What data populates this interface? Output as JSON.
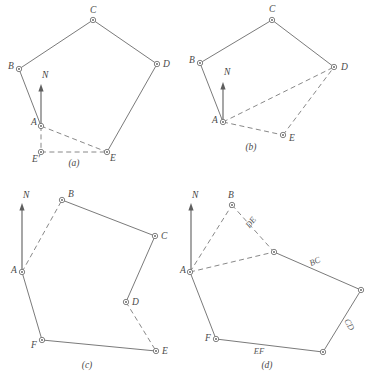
{
  "figure": {
    "panels": [
      {
        "id": "a",
        "caption": "(a)",
        "caption_pos": [
          74,
          166
        ],
        "north_label": "N",
        "north_label_pos": [
          42,
          78
        ],
        "north_arrow": {
          "x": 41,
          "y_tail": 128,
          "y_head": 84
        },
        "stations": [
          {
            "name": "A",
            "x": 41,
            "y": 126,
            "label": "A",
            "lx": 31,
            "ly": 125
          },
          {
            "name": "B",
            "x": 19,
            "y": 69,
            "label": "B",
            "lx": 8,
            "ly": 69
          },
          {
            "name": "C",
            "x": 93,
            "y": 20,
            "label": "C",
            "lx": 90,
            "ly": 13
          },
          {
            "name": "D",
            "x": 157,
            "y": 64,
            "label": "D",
            "lx": 163,
            "ly": 67
          },
          {
            "name": "E",
            "x": 107,
            "y": 152,
            "label": "E",
            "lx": 110,
            "ly": 161
          },
          {
            "name": "Ep",
            "x": 41,
            "y": 152,
            "label": "E'",
            "lx": 32,
            "ly": 162
          }
        ],
        "solid_edges": [
          [
            "A",
            "B"
          ],
          [
            "B",
            "C"
          ],
          [
            "C",
            "D"
          ],
          [
            "D",
            "E"
          ]
        ],
        "dashed_edges": [
          [
            "A",
            "E"
          ],
          [
            "A",
            "Ep"
          ],
          [
            "Ep",
            "E"
          ]
        ],
        "side_labels": []
      },
      {
        "id": "b",
        "caption": "(b)",
        "caption_pos": [
          251,
          150
        ],
        "north_label": "N",
        "north_label_pos": [
          224,
          75
        ],
        "north_arrow": {
          "x": 223,
          "y_tail": 124,
          "y_head": 82
        },
        "stations": [
          {
            "name": "A",
            "x": 223,
            "y": 122,
            "label": "A",
            "lx": 212,
            "ly": 123
          },
          {
            "name": "B",
            "x": 200,
            "y": 63,
            "label": "B",
            "lx": 189,
            "ly": 63
          },
          {
            "name": "C",
            "x": 272,
            "y": 20,
            "label": "C",
            "lx": 269,
            "ly": 12
          },
          {
            "name": "D",
            "x": 334,
            "y": 67,
            "label": "D",
            "lx": 341,
            "ly": 70
          },
          {
            "name": "E",
            "x": 283,
            "y": 135,
            "label": "E",
            "lx": 289,
            "ly": 141
          }
        ],
        "solid_edges": [
          [
            "A",
            "B"
          ],
          [
            "B",
            "C"
          ],
          [
            "C",
            "D"
          ]
        ],
        "dashed_edges": [
          [
            "A",
            "D"
          ],
          [
            "A",
            "E"
          ],
          [
            "E",
            "D"
          ]
        ],
        "side_labels": []
      },
      {
        "id": "c",
        "caption": "(c)",
        "caption_pos": [
          87,
          368
        ],
        "north_label": "N",
        "north_label_pos": [
          23,
          198
        ],
        "north_arrow": {
          "x": 22,
          "y_tail": 270,
          "y_head": 203
        },
        "stations": [
          {
            "name": "A",
            "x": 22,
            "y": 272,
            "label": "A",
            "lx": 11,
            "ly": 273
          },
          {
            "name": "B",
            "x": 62,
            "y": 200,
            "label": "B",
            "lx": 68,
            "ly": 197
          },
          {
            "name": "C",
            "x": 155,
            "y": 236,
            "label": "C",
            "lx": 161,
            "ly": 239
          },
          {
            "name": "D",
            "x": 126,
            "y": 302,
            "label": "D",
            "lx": 132,
            "ly": 305
          },
          {
            "name": "E",
            "x": 156,
            "y": 351,
            "label": "E",
            "lx": 162,
            "ly": 354
          },
          {
            "name": "F",
            "x": 42,
            "y": 340,
            "label": "F",
            "lx": 31,
            "ly": 348
          }
        ],
        "solid_edges": [
          [
            "B",
            "C"
          ],
          [
            "C",
            "D"
          ],
          [
            "A",
            "F"
          ],
          [
            "F",
            "E"
          ]
        ],
        "dashed_edges": [
          [
            "A",
            "B"
          ],
          [
            "D",
            "E"
          ]
        ],
        "side_labels": []
      },
      {
        "id": "d",
        "caption": "(d)",
        "caption_pos": [
          267,
          368
        ],
        "north_label": "N",
        "north_label_pos": [
          192,
          198
        ],
        "north_arrow": {
          "x": 191,
          "y_tail": 270,
          "y_head": 203
        },
        "stations": [
          {
            "name": "A",
            "x": 190,
            "y": 272,
            "label": "A",
            "lx": 180,
            "ly": 273
          },
          {
            "name": "B",
            "x": 232,
            "y": 205,
            "label": "B",
            "lx": 228,
            "ly": 198
          },
          {
            "name": "Bp",
            "x": 274,
            "y": 252,
            "label": "",
            "lx": 0,
            "ly": 0
          },
          {
            "name": "C",
            "x": 361,
            "y": 290,
            "label": "",
            "lx": 0,
            "ly": 0
          },
          {
            "name": "D",
            "x": 323,
            "y": 352,
            "label": "",
            "lx": 0,
            "ly": 0
          },
          {
            "name": "F",
            "x": 216,
            "y": 339,
            "label": "F",
            "lx": 205,
            "ly": 341
          }
        ],
        "solid_edges": [
          [
            "Bp",
            "C"
          ],
          [
            "C",
            "D"
          ],
          [
            "D",
            "F"
          ],
          [
            "F",
            "A"
          ]
        ],
        "dashed_edges": [
          [
            "A",
            "B"
          ],
          [
            "B",
            "Bp"
          ],
          [
            "A",
            "Bp"
          ]
        ],
        "side_labels": [
          {
            "text": "DE",
            "x": 253,
            "y": 224,
            "rotate": 52
          },
          {
            "text": "BC",
            "x": 316,
            "y": 264,
            "rotate": 24
          },
          {
            "text": "CD",
            "x": 347,
            "y": 326,
            "rotate": -59
          },
          {
            "text": "EF",
            "x": 259,
            "y": 354,
            "rotate": 0
          }
        ]
      }
    ]
  },
  "colors": {
    "line": "#6b6b6b",
    "dashed": "#7a7a7a",
    "label": "#4a4a4a",
    "background": "#ffffff"
  }
}
